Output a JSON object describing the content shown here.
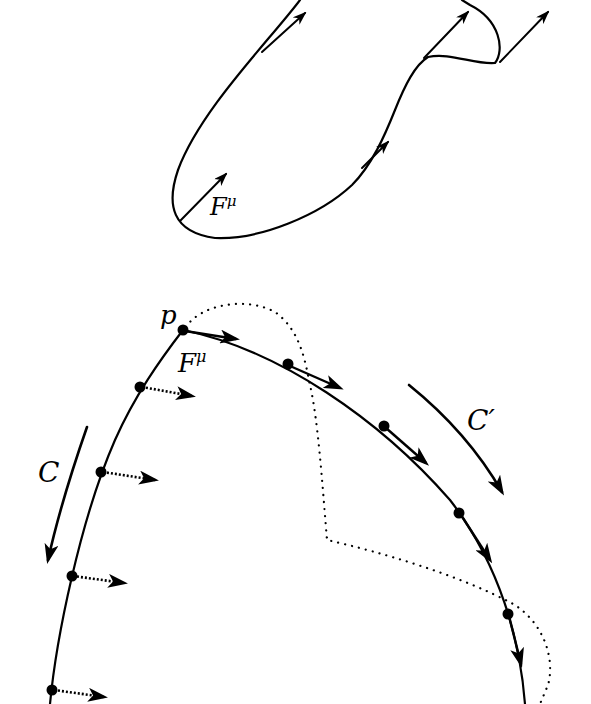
{
  "figure": {
    "top_panel": {
      "description": "Closed curve with tangent/displacement vectors F^mu at several points",
      "vector_label": "F",
      "vector_label_sup": "μ"
    },
    "bottom_panel": {
      "point_label": "p",
      "vector_label": "F",
      "vector_label_sup": "μ",
      "curve_label_left": "C",
      "curve_label_right": "C",
      "curve_label_right_prime": "′",
      "elements": {
        "solid_curve": "curve through p with dots (points) and arrows",
        "dotted_curve": "deformed path (dotted)",
        "left_vectors": "dotted vector arrows pointing right along C",
        "right_vectors": "tangent arrows along C'"
      }
    },
    "colors": {
      "stroke": "#000000",
      "background": "#ffffff"
    }
  }
}
